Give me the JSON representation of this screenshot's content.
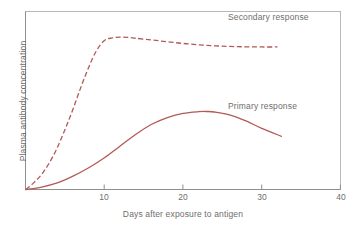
{
  "chart_data": {
    "type": "line",
    "title": "",
    "xlabel": "Days after exposure to antigen",
    "ylabel": "Plasma antibody concentration",
    "xlim": [
      0,
      40
    ],
    "ylim": [
      0,
      1
    ],
    "xticks": [
      10,
      20,
      30,
      40
    ],
    "yticks": [],
    "grid": false,
    "legend_position": "inline-annotation",
    "series": [
      {
        "name": "Secondary response",
        "style": "dashed",
        "color": "#b25a55",
        "x": [
          0,
          1,
          2,
          3,
          4,
          5,
          6,
          7,
          8,
          9,
          10,
          11,
          12,
          13,
          14,
          16,
          18,
          20,
          22,
          24,
          26,
          28,
          30,
          32
        ],
        "y": [
          0.0,
          0.04,
          0.09,
          0.16,
          0.25,
          0.36,
          0.48,
          0.61,
          0.73,
          0.83,
          0.89,
          0.905,
          0.91,
          0.908,
          0.903,
          0.893,
          0.882,
          0.872,
          0.864,
          0.858,
          0.854,
          0.852,
          0.851,
          0.851
        ]
      },
      {
        "name": "Primary response",
        "style": "solid",
        "color": "#b25a55",
        "x": [
          0,
          2,
          4,
          6,
          8,
          10,
          12,
          14,
          16,
          18,
          20,
          22,
          23,
          24,
          26,
          28,
          30,
          32.5
        ],
        "y": [
          0.0,
          0.015,
          0.04,
          0.08,
          0.13,
          0.19,
          0.26,
          0.33,
          0.39,
          0.43,
          0.455,
          0.465,
          0.466,
          0.463,
          0.445,
          0.41,
          0.365,
          0.318
        ]
      }
    ],
    "annotations": [
      {
        "text": "Secondary response",
        "x": 29,
        "y": 0.99
      },
      {
        "text": "Primary response",
        "x": 29,
        "y": 0.53
      }
    ]
  },
  "axes": {
    "x_title": "Days after exposure to antigen",
    "y_title": "Plasma antibody concentration",
    "x_tick_labels": [
      "10",
      "20",
      "30",
      "40"
    ]
  },
  "colors": {
    "curve": "#b25a55",
    "frame": "#b0b0b0",
    "axis": "#8a8a8a",
    "text": "#6e6e6e",
    "background": "#ffffff"
  }
}
